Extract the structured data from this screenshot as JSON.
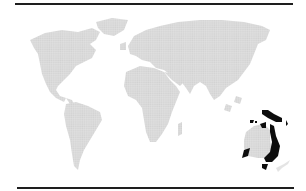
{
  "map": {
    "type": "world-map",
    "style": "dotted-grey-landmass",
    "highlighted_region": "Australia & New Guinea (Oceania)",
    "colors": {
      "land": "#d8d8d8",
      "highlight": "#0d0d0d",
      "background": "#ffffff",
      "rules": "#1e1e1e"
    }
  }
}
